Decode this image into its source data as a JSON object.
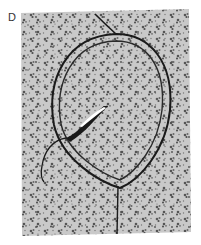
{
  "figure": {
    "panel_label": "D",
    "colors": {
      "background": "#ffffff",
      "texture_base": "#c8c8c8",
      "texture_spots": "#555555",
      "line": "#1a1a1a",
      "highlight": "#ffffff"
    },
    "elements": [
      "textured-tissue-panel",
      "outer-loop",
      "inner-loop",
      "incoming-thread",
      "needle",
      "thread-tail",
      "vertical-thread"
    ]
  }
}
